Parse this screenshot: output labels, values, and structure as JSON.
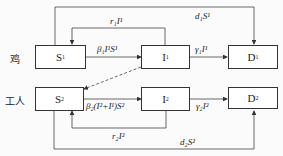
{
  "rows": {
    "chicken": "鸡",
    "worker": "工人"
  },
  "nodes": {
    "S1": {
      "base": "S",
      "sup": "1"
    },
    "I1": {
      "base": "I",
      "sup": "1"
    },
    "D1": {
      "base": "D",
      "sup": "1"
    },
    "S2": {
      "base": "S",
      "sup": "2"
    },
    "I2": {
      "base": "I",
      "sup": "2"
    },
    "D2": {
      "base": "D",
      "sup": "2"
    }
  },
  "edges": {
    "r1": "r₁I¹",
    "d1": "d₁S¹",
    "beta1": "β₁I¹S¹",
    "gamma1": "γ₁I¹",
    "beta2": "β₂(I²+I¹)S²",
    "gamma2": "γ₂I²",
    "r2": "r₂I²",
    "d2": "d₂S²"
  }
}
